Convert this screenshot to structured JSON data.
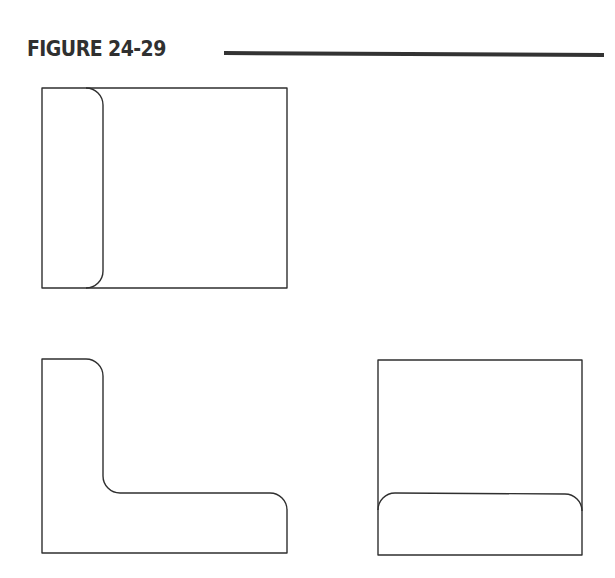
{
  "figure": {
    "title": "FIGURE 24-29",
    "rule_color": "#333333",
    "line_color": "#2f2f2f"
  },
  "views": [
    {
      "id": "top-view",
      "description": "Rectangle with rounded-edge strip along left side"
    },
    {
      "id": "front-view",
      "description": "L-shaped profile with filleted corners"
    },
    {
      "id": "side-view",
      "description": "Rectangle with rounded-edge band along bottom"
    }
  ]
}
